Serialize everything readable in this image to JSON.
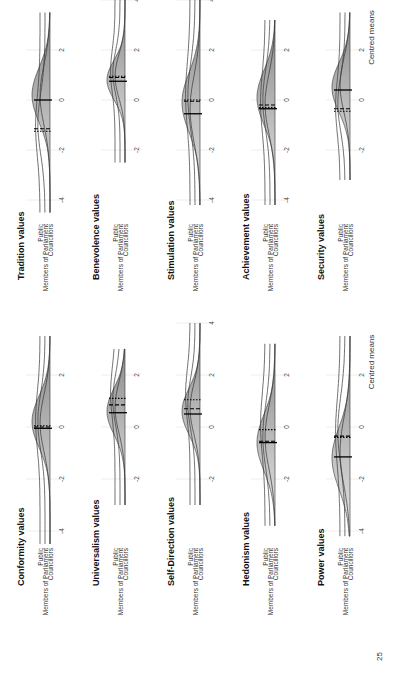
{
  "page": {
    "number": "25"
  },
  "axis": {
    "xlabel": "Centred means",
    "ticks": [
      -4,
      -2,
      0,
      2,
      4
    ]
  },
  "groups": [
    "Public",
    "Members of Parliament",
    "Councillors"
  ],
  "line_styles": {
    "Public": "dotted",
    "Members of Parliament": "dashed",
    "Councillors": "solid"
  },
  "colors": {
    "fill_light": "#e6e6e6",
    "fill_dark": "#8a8a8a",
    "line": "#333333",
    "grid": "#eeeeee"
  },
  "chart_data": [
    {
      "type": "ridgeline",
      "title": "Conformity values",
      "column": "left",
      "row": 0,
      "xlim": [
        -4.5,
        3.5
      ],
      "ticks": [
        -4,
        -2,
        0,
        2
      ],
      "means": {
        "Public": 0.05,
        "Members of Parliament": 0.0,
        "Councillors": -0.05
      },
      "peak": 0.2,
      "spread": 1.0
    },
    {
      "type": "ridgeline",
      "title": "Universalism values",
      "column": "left",
      "row": 1,
      "xlim": [
        -3,
        3
      ],
      "ticks": [
        -2,
        0,
        2
      ],
      "means": {
        "Public": 1.1,
        "Members of Parliament": 0.85,
        "Councillors": 0.55
      },
      "peak": 0.6,
      "spread": 0.9
    },
    {
      "type": "ridgeline",
      "title": "Self-Direction values",
      "column": "left",
      "row": 2,
      "xlim": [
        -3,
        4
      ],
      "ticks": [
        -2,
        0,
        2,
        4
      ],
      "means": {
        "Public": 1.05,
        "Members of Parliament": 0.7,
        "Councillors": 0.5
      },
      "peak": 0.6,
      "spread": 0.9
    },
    {
      "type": "ridgeline",
      "title": "Hedonism values",
      "column": "left",
      "row": 3,
      "xlim": [
        -3.8,
        3.2
      ],
      "ticks": [
        -2,
        0,
        2
      ],
      "means": {
        "Public": -0.1,
        "Members of Parliament": -0.55,
        "Councillors": -0.6
      },
      "peak": -0.6,
      "spread": 1.1
    },
    {
      "type": "ridgeline",
      "title": "Power values",
      "column": "left",
      "row": 4,
      "xlim": [
        -4.2,
        3.5
      ],
      "ticks": [
        -4,
        -2,
        0,
        2
      ],
      "means": {
        "Public": -0.4,
        "Members of Parliament": -0.35,
        "Councillors": -1.15
      },
      "peak": -1.2,
      "spread": 1.2
    },
    {
      "type": "ridgeline",
      "title": "Tradition values",
      "column": "right",
      "row": 0,
      "xlim": [
        -4.5,
        3.5
      ],
      "ticks": [
        -4,
        -2,
        0,
        2
      ],
      "means": {
        "Public": -1.25,
        "Members of Parliament": -1.15,
        "Councillors": 0.0
      },
      "peak": 0.2,
      "spread": 1.1
    },
    {
      "type": "ridgeline",
      "title": "Benevolence values",
      "column": "right",
      "row": 1,
      "xlim": [
        -2.5,
        4
      ],
      "ticks": [
        -2,
        0,
        2,
        4
      ],
      "means": {
        "Public": 0.95,
        "Members of Parliament": 0.9,
        "Councillors": 0.75
      },
      "peak": 0.8,
      "spread": 0.8
    },
    {
      "type": "ridgeline",
      "title": "Stimulation values",
      "column": "right",
      "row": 2,
      "xlim": [
        -4.2,
        4
      ],
      "ticks": [
        -4,
        -2,
        0,
        2,
        4
      ],
      "means": {
        "Public": 0.0,
        "Members of Parliament": -0.05,
        "Councillors": -0.55
      },
      "peak": -0.1,
      "spread": 1.2
    },
    {
      "type": "ridgeline",
      "title": "Achievement values",
      "column": "right",
      "row": 3,
      "xlim": [
        -4.2,
        3.2
      ],
      "ticks": [
        -4,
        -2,
        0,
        2
      ],
      "means": {
        "Public": -0.3,
        "Members of Parliament": -0.2,
        "Councillors": -0.35
      },
      "peak": 0.1,
      "spread": 1.1
    },
    {
      "type": "ridgeline",
      "title": "Security values",
      "column": "right",
      "row": 4,
      "xlim": [
        -3.2,
        3.5
      ],
      "ticks": [
        -2,
        0,
        2
      ],
      "means": {
        "Public": -0.45,
        "Members of Parliament": -0.35,
        "Councillors": 0.4
      },
      "peak": 0.5,
      "spread": 1.0
    }
  ]
}
